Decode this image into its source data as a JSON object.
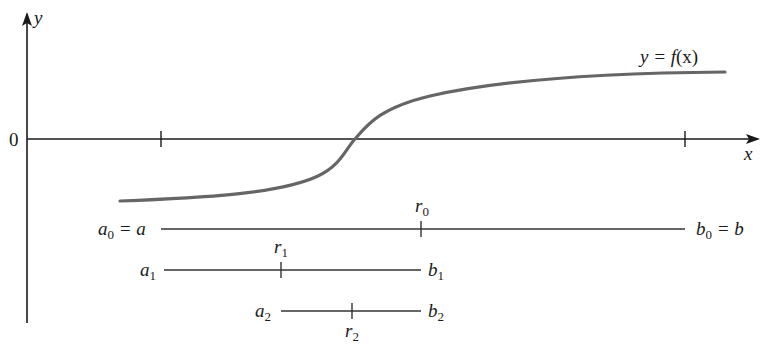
{
  "axes": {
    "x_label": "x",
    "y_label": "y",
    "origin_label": "0",
    "x_ticks_px": [
      161,
      685
    ]
  },
  "curve": {
    "label": "y = f(x)",
    "label_prefix": "y = ",
    "label_func": "f",
    "label_arg": "(x)",
    "color": "#666666"
  },
  "intervals": [
    {
      "a_label": "a",
      "a_sub": "0",
      "a_suffix": " = a",
      "b_label": "b",
      "b_sub": "0",
      "b_suffix": " = b",
      "r_label": "r",
      "r_sub": "0"
    },
    {
      "a_label": "a",
      "a_sub": "1",
      "a_suffix": "",
      "b_label": "b",
      "b_sub": "1",
      "b_suffix": "",
      "r_label": "r",
      "r_sub": "1"
    },
    {
      "a_label": "a",
      "a_sub": "2",
      "a_suffix": "",
      "b_label": "b",
      "b_sub": "2",
      "b_suffix": "",
      "r_label": "r",
      "r_sub": "2"
    }
  ],
  "colors": {
    "axis": "#1a1a1a",
    "curve": "#666666",
    "interval": "#333333"
  }
}
